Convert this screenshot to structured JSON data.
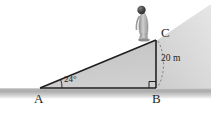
{
  "figure": {
    "vertices": {
      "a_label": "A",
      "b_label": "B",
      "c_label": "C"
    },
    "angle": {
      "at": "A",
      "label": "24°",
      "value": 24,
      "unit": "degrees"
    },
    "measurement": {
      "label": "20 m",
      "value": 20,
      "unit": "m",
      "segment": "BC"
    },
    "right_angle": {
      "at": "B",
      "label": "",
      "value": 90
    },
    "figures": {
      "person_label": "person standing at C"
    },
    "colors": {
      "stroke": "#231f20",
      "triangle_fill": "#c9c9c9",
      "wedge_fill": "#d8d8d8",
      "ground": "#b5b5b5",
      "person_body": "#b3b3b3",
      "person_head": "#4a4a4a",
      "text": "#231f20"
    },
    "geometry": {
      "a_point": [
        40,
        88
      ],
      "b_point": [
        156,
        88
      ],
      "c_point": [
        156,
        40
      ]
    }
  }
}
